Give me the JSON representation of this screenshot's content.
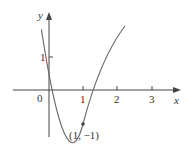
{
  "diagram": {
    "title": "",
    "axes": {
      "x_label": "x",
      "y_label": "y",
      "origin_label": "0",
      "x_ticks": [
        "1",
        "2",
        "3"
      ],
      "y_ticks": [
        "1"
      ]
    },
    "curve": {
      "type": "parabola",
      "equation": "y = 2x^2 - 4x + 1",
      "color": "#555555"
    },
    "points": [
      {
        "x": 1,
        "y": -1,
        "label": "(1, −1)"
      }
    ]
  }
}
